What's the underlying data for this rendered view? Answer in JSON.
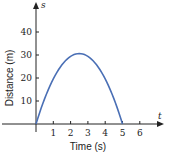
{
  "chart_data": {
    "type": "line",
    "title": "",
    "xlabel": "Time (s)",
    "ylabel": "Distance (m)",
    "x_axis_var": "t",
    "y_axis_var": "s",
    "xlim": [
      0,
      7
    ],
    "ylim": [
      0,
      48
    ],
    "x_ticks": [
      1,
      2,
      3,
      4,
      5,
      6
    ],
    "y_ticks": [
      10,
      20,
      30,
      40
    ],
    "grid": false,
    "legend": null,
    "series": [
      {
        "name": "s(t)",
        "color": "#4a6fb5",
        "x": [
          0,
          0.5,
          1,
          1.5,
          2,
          2.5,
          3,
          3.5,
          4,
          4.5,
          5
        ],
        "y": [
          0,
          11.0,
          19.6,
          25.7,
          29.4,
          30.6,
          29.4,
          25.7,
          19.6,
          11.0,
          0
        ]
      }
    ]
  }
}
